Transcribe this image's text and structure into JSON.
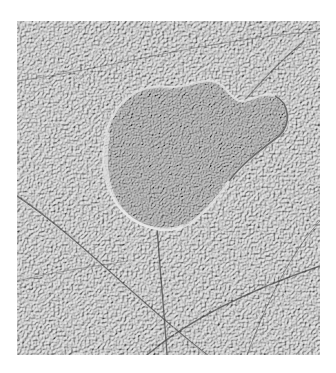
{
  "image": {
    "subject": "grayscale icy moon surface with a large rounded chaos feature and crossing ridges",
    "alt": "Grayscale surface image with ridged terrain and a large lobate chaos region in the center",
    "colors": {
      "base": "#9c9c9c",
      "light": "#d8d8d8",
      "dark": "#3a3a3a",
      "background": "#ffffff"
    }
  }
}
